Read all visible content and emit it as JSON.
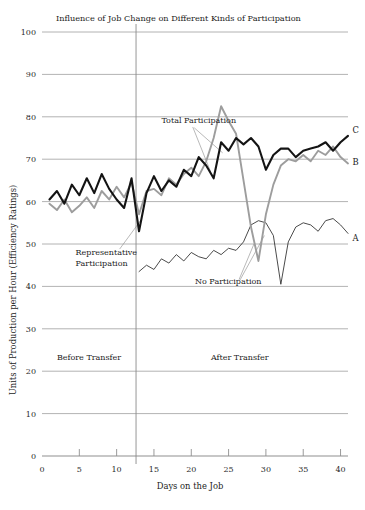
{
  "chart_data": {
    "type": "line",
    "title": "Influence of Job Change on Different Kinds of Participation",
    "xlabel": "Days on the Job",
    "ylabel": "Units of Production per Hour (Efficiency Ratings)",
    "xlim": [
      0,
      41
    ],
    "ylim": [
      0,
      100
    ],
    "xticks": [
      0,
      5,
      10,
      15,
      20,
      25,
      30,
      35,
      40
    ],
    "xtick_labels": [
      "0",
      "5",
      "10",
      "15",
      "20",
      "25",
      "30",
      "35",
      "40"
    ],
    "yticks": [
      0,
      10,
      20,
      30,
      40,
      50,
      60,
      70,
      80,
      90,
      100
    ],
    "ytick_labels": [
      "0",
      "10",
      "20",
      "30",
      "40",
      "50",
      "60",
      "70",
      "80",
      "90",
      "100"
    ],
    "grid": "horizontal",
    "legend": "none",
    "colors": {
      "series_a": "#2b2b2b",
      "series_b": "#9d9d9d",
      "series_c": "#141414",
      "gridline": "#9a9a9a",
      "axis": "#8f8f8f",
      "text": "#1c1c1c"
    },
    "divider": {
      "x": 12.6,
      "label_before": "Before Transfer",
      "label_after": "After Transfer"
    },
    "annotations": [
      {
        "text": "Total Participation",
        "x": 16.0,
        "y": 78.5
      },
      {
        "text": "Representative Participation",
        "x": 4.5,
        "y": 47.5
      },
      {
        "text": "No Participation",
        "x": 20.5,
        "y": 40.5
      }
    ],
    "endpoint_labels": [
      {
        "text": "C",
        "x": 41.6,
        "y": 76.2
      },
      {
        "text": "B",
        "x": 41.6,
        "y": 68.6
      },
      {
        "text": "A",
        "x": 41.6,
        "y": 50.6
      }
    ],
    "series": [
      {
        "name": "A",
        "label": "No Participation",
        "style": "thin-black",
        "x": [
          13,
          14,
          15,
          16,
          17,
          18,
          19,
          20,
          21,
          22,
          23,
          24,
          25,
          26,
          27,
          28,
          29,
          30,
          31,
          32,
          33,
          34,
          35,
          36,
          37,
          38,
          39,
          40,
          41
        ],
        "values": [
          43.5,
          45.0,
          44.0,
          46.5,
          45.5,
          47.5,
          46.0,
          48.0,
          47.0,
          46.5,
          48.5,
          47.5,
          49.0,
          48.5,
          50.5,
          54.5,
          55.5,
          55.0,
          52.0,
          40.5,
          50.5,
          54.0,
          55.0,
          54.5,
          53.0,
          55.5,
          56.0,
          54.5,
          52.5
        ]
      },
      {
        "name": "B",
        "label": "Representative Participation",
        "style": "medium-gray",
        "x": [
          1,
          2,
          3,
          4,
          5,
          6,
          7,
          8,
          9,
          10,
          11,
          12,
          13,
          14,
          15,
          16,
          17,
          18,
          19,
          20,
          21,
          22,
          23,
          24,
          25,
          26,
          27,
          28,
          29,
          30,
          31,
          32,
          33,
          34,
          35,
          36,
          37,
          38,
          39,
          40,
          41
        ],
        "values": [
          59.5,
          58.0,
          60.5,
          57.5,
          59.0,
          61.0,
          58.5,
          62.5,
          60.5,
          63.5,
          61.0,
          64.5,
          57.0,
          62.5,
          63.0,
          61.5,
          65.5,
          64.0,
          66.5,
          68.0,
          66.0,
          69.5,
          75.0,
          82.5,
          79.0,
          76.0,
          65.0,
          54.0,
          46.0,
          57.0,
          64.0,
          68.5,
          70.0,
          69.5,
          71.0,
          69.5,
          72.0,
          71.0,
          73.0,
          70.5,
          69.0
        ]
      },
      {
        "name": "C",
        "label": "Total Participation",
        "style": "thick-black",
        "x": [
          1,
          2,
          3,
          4,
          5,
          6,
          7,
          8,
          9,
          10,
          11,
          12,
          13,
          14,
          15,
          16,
          17,
          18,
          19,
          20,
          21,
          22,
          23,
          24,
          25,
          26,
          27,
          28,
          29,
          30,
          31,
          32,
          33,
          34,
          35,
          36,
          37,
          38,
          39,
          40,
          41
        ],
        "values": [
          60.5,
          62.5,
          59.5,
          64.0,
          61.5,
          65.5,
          62.0,
          66.5,
          63.0,
          60.5,
          58.5,
          65.5,
          53.0,
          62.0,
          66.0,
          62.5,
          65.0,
          63.5,
          67.5,
          66.0,
          70.5,
          68.5,
          65.5,
          74.0,
          72.0,
          75.0,
          73.5,
          75.0,
          73.0,
          67.5,
          71.0,
          72.5,
          72.5,
          70.5,
          72.0,
          72.5,
          73.0,
          74.0,
          72.0,
          74.0,
          75.5
        ]
      }
    ]
  }
}
